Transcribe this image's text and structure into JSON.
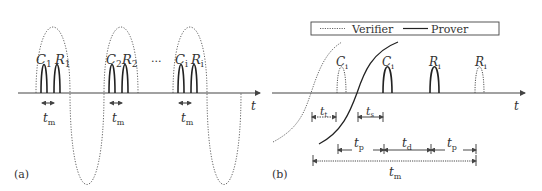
{
  "panel_a": {
    "label": "(a)",
    "axis_label": "t",
    "ellipsis": "...",
    "groups": [
      {
        "c": "C",
        "c_sub": "1",
        "r": "R",
        "r_sub": "1",
        "tm": "t",
        "tm_sub": "m"
      },
      {
        "c": "C",
        "c_sub": "2",
        "r": "R",
        "r_sub": "2",
        "tm": "t",
        "tm_sub": "m"
      },
      {
        "c": "C",
        "c_sub": "i",
        "r": "R",
        "r_sub": "i",
        "tm": "t",
        "tm_sub": "m"
      }
    ]
  },
  "panel_b": {
    "label": "(b)",
    "axis_label": "t",
    "legend": {
      "verifier": "Verifier",
      "prover": "Prover"
    },
    "pulses": [
      {
        "name": "C",
        "sub": "i",
        "style": "dotted"
      },
      {
        "name": "C",
        "sub": "i",
        "style": "solid"
      },
      {
        "name": "R",
        "sub": "i",
        "style": "solid"
      },
      {
        "name": "R",
        "sub": "i",
        "style": "dotted"
      }
    ],
    "intervals": {
      "t_t": {
        "t": "t",
        "sub": "t"
      },
      "t_s": {
        "t": "t",
        "sub": "s"
      },
      "t_p1": {
        "t": "t",
        "sub": "p"
      },
      "t_d": {
        "t": "t",
        "sub": "d"
      },
      "t_p2": {
        "t": "t",
        "sub": "p"
      },
      "t_m": {
        "t": "t",
        "sub": "m"
      }
    }
  }
}
